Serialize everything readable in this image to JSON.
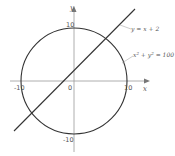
{
  "diagram": {
    "type": "coordinate-plot",
    "axes": {
      "x_label": "x",
      "y_label": "y",
      "origin_label": "0",
      "x_ticks": [
        "-10",
        "10"
      ],
      "y_ticks": [
        "10",
        "-10"
      ]
    },
    "curves": [
      {
        "name": "circle",
        "equation": "x² + y² = 100",
        "label_main": "x",
        "label_sup": "2",
        "label_mid": " + y",
        "label_sup2": "2",
        "label_end": " = 100"
      },
      {
        "name": "line",
        "equation": "y = x + 2",
        "label": "y = x + 2"
      }
    ],
    "colors": {
      "curve": "#333333",
      "axis": "#888888",
      "text": "#555555"
    }
  }
}
